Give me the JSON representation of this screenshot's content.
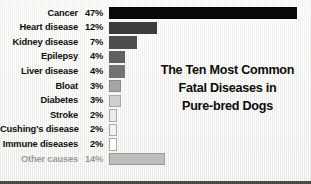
{
  "chart_data": {
    "type": "bar",
    "title_lines": [
      "The Ten Most Common",
      "Fatal Diseases in",
      "Pure-bred Dogs"
    ],
    "orientation": "horizontal",
    "xlabel": "",
    "ylabel": "",
    "grid": false,
    "legend": "none",
    "xlim": [
      0,
      47
    ],
    "categories": [
      "Cancer",
      "Heart disease",
      "Kidney disease",
      "Epilepsy",
      "Liver disease",
      "Bloat",
      "Diabetes",
      "Stroke",
      "Cushing's disease",
      "Immune diseases",
      "Other causes"
    ],
    "values": [
      47,
      12,
      7,
      4,
      4,
      3,
      3,
      2,
      2,
      2,
      14
    ],
    "value_labels": [
      "47%",
      "12%",
      "7%",
      "4%",
      "4%",
      "3%",
      "3%",
      "2%",
      "2%",
      "2%",
      "14%"
    ],
    "bars": [
      {
        "label": "Cancer",
        "value": 47,
        "value_label": "47%",
        "fill": "#080808",
        "border": "#080808",
        "muted": false
      },
      {
        "label": "Heart disease",
        "value": 12,
        "value_label": "12%",
        "fill": "#3b3b3b",
        "border": "#3b3b3b",
        "muted": false
      },
      {
        "label": "Kidney disease",
        "value": 7,
        "value_label": "7%",
        "fill": "#4e4e4e",
        "border": "#4e4e4e",
        "muted": false
      },
      {
        "label": "Epilepsy",
        "value": 4,
        "value_label": "4%",
        "fill": "#616161",
        "border": "#616161",
        "muted": false
      },
      {
        "label": "Liver disease",
        "value": 4,
        "value_label": "4%",
        "fill": "#737373",
        "border": "#737373",
        "muted": false
      },
      {
        "label": "Bloat",
        "value": 3,
        "value_label": "3%",
        "fill": "#a5a5a2",
        "border": "#8a8a87",
        "muted": false
      },
      {
        "label": "Diabetes",
        "value": 3,
        "value_label": "3%",
        "fill": "#cfcfcc",
        "border": "#a8a8a4",
        "muted": false
      },
      {
        "label": "Stroke",
        "value": 2,
        "value_label": "2%",
        "fill": "#ebebe8",
        "border": "#a8a8a4",
        "muted": false
      },
      {
        "label": "Cushing's disease",
        "value": 2,
        "value_label": "2%",
        "fill": "#f3f3f1",
        "border": "#a8a8a4",
        "muted": false
      },
      {
        "label": "Immune diseases",
        "value": 2,
        "value_label": "2%",
        "fill": "#ffffff",
        "border": "#a8a8a4",
        "muted": false
      },
      {
        "label": "Other causes",
        "value": 14,
        "value_label": "14%",
        "fill": "#bdbdba",
        "border": "#9a9a97",
        "muted": true
      }
    ],
    "colors": {
      "background": "#f0f0ed",
      "label_text": "#100f0d",
      "muted_text": "#9a9a96",
      "title_text": "#0d0d0b",
      "bottom_rule": "#4a4a4a"
    }
  }
}
